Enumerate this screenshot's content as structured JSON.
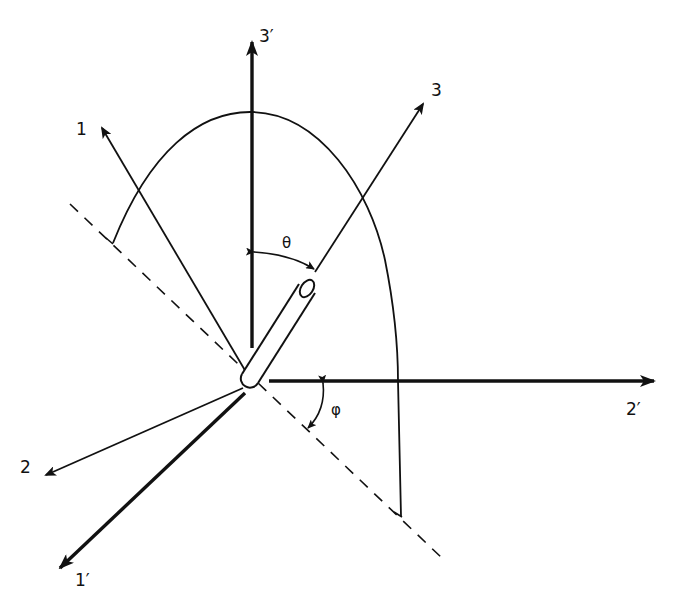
{
  "figure": {
    "colors": {
      "ink": "#111111",
      "background": "#ffffff"
    }
  },
  "axes": [
    {
      "id": "3prime",
      "label": "3′",
      "weight": "thick"
    },
    {
      "id": "2prime",
      "label": "2′",
      "weight": "thick"
    },
    {
      "id": "1prime",
      "label": "1′",
      "weight": "thick"
    },
    {
      "id": "3",
      "label": "3",
      "weight": "thin"
    },
    {
      "id": "1",
      "label": "1",
      "weight": "thin"
    },
    {
      "id": "2",
      "label": "2",
      "weight": "thin"
    }
  ],
  "angles": {
    "theta": {
      "symbol": "θ",
      "between": [
        "3prime",
        "3"
      ]
    },
    "phi": {
      "symbol": "φ",
      "between": [
        "2prime",
        "projection-line"
      ]
    }
  },
  "elements": {
    "rod": "cylinder along axis 3 at origin",
    "projection_line": "dashed",
    "arc": "great-circle arc through 3' and 3"
  }
}
